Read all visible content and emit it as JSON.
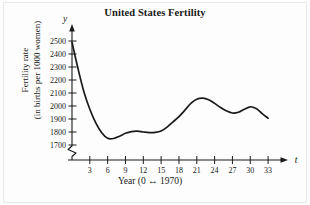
{
  "figure": {
    "title": "United States Fertility",
    "y_axis_symbol": "y",
    "x_axis_symbol": "t",
    "y_caption_line1": "Fertility rate",
    "y_caption_line2": "(in births per 1000 women)",
    "x_caption": "Year (0 ↔ 1970)",
    "ink_color": "#1a1a1a",
    "background_color": "#fdfdfd"
  },
  "chart_data": {
    "type": "line",
    "title": "United States Fertility",
    "xlabel": "Year (0 ↔ 1970)",
    "ylabel": "Fertility rate (in births per 1000 women)",
    "xlim": [
      0,
      34.5
    ],
    "ylim": [
      1650,
      2550
    ],
    "y_axis_break": true,
    "grid": false,
    "legend": "none",
    "xticks": [
      3,
      6,
      9,
      12,
      15,
      18,
      21,
      24,
      27,
      30,
      33
    ],
    "xtick_labels": [
      "3",
      "6",
      "9",
      "12",
      "15",
      "18",
      "21",
      "24",
      "27",
      "30",
      "33"
    ],
    "yticks": [
      1700,
      1800,
      1900,
      2000,
      2100,
      2200,
      2300,
      2400,
      2500
    ],
    "ytick_labels": [
      "1700",
      "1800",
      "1900",
      "2000",
      "2100",
      "2200",
      "2300",
      "2400",
      "2500"
    ],
    "series": [
      {
        "name": "Fertility rate",
        "x": [
          0,
          1,
          2,
          3,
          4,
          5,
          6,
          7,
          8,
          9,
          10,
          11,
          12,
          13,
          14,
          15,
          16,
          17,
          18,
          19,
          20,
          21,
          22,
          23,
          24,
          25,
          26,
          27,
          28,
          29,
          30,
          31,
          32,
          33
        ],
        "values": [
          2490,
          2290,
          2110,
          1975,
          1870,
          1795,
          1752,
          1750,
          1768,
          1790,
          1803,
          1806,
          1800,
          1795,
          1797,
          1808,
          1838,
          1878,
          1918,
          1968,
          2020,
          2052,
          2060,
          2048,
          2020,
          1988,
          1962,
          1946,
          1952,
          1975,
          1994,
          1980,
          1942,
          1906
        ]
      }
    ]
  }
}
